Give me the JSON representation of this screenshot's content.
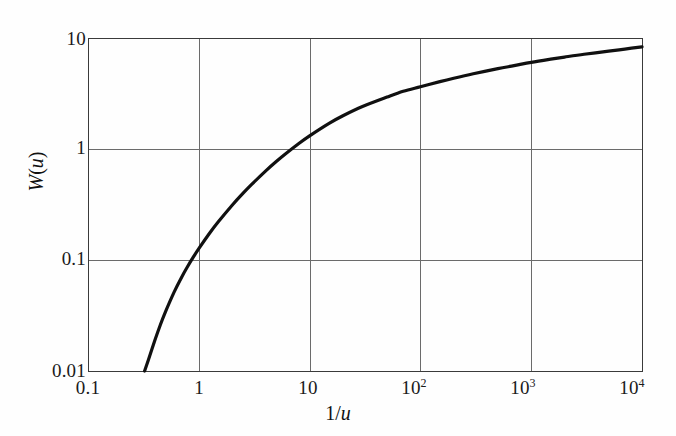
{
  "figure": {
    "background_color": "#fefefe",
    "axis_color": "#3a3a3a",
    "grid_color": "#6b6b6b",
    "curve_color": "#101010"
  },
  "axes": {
    "x_label_plain": "1/",
    "x_label_italic": "u",
    "y_label_plain_w": "W",
    "y_label_open": "(",
    "y_label_italic": "u",
    "y_label_close": ")",
    "x_ticks": [
      {
        "text": "0.1",
        "sup": "",
        "value": 0.1
      },
      {
        "text": "1",
        "sup": "",
        "value": 1
      },
      {
        "text": "10",
        "sup": "",
        "value": 10
      },
      {
        "text": "10",
        "sup": "2",
        "value": 100
      },
      {
        "text": "10",
        "sup": "3",
        "value": 1000
      },
      {
        "text": "10",
        "sup": "4",
        "value": 10000
      }
    ],
    "y_ticks": [
      {
        "text": "10",
        "value": 10
      },
      {
        "text": "1",
        "value": 1
      },
      {
        "text": "0.1",
        "value": 0.1
      },
      {
        "text": "0.01",
        "value": 0.01
      }
    ]
  },
  "chart_data": {
    "type": "line",
    "title": "",
    "xlabel": "1/u",
    "ylabel": "W(u)",
    "xscale": "log",
    "yscale": "log",
    "xlim": [
      0.1,
      10000
    ],
    "ylim": [
      0.01,
      10
    ],
    "grid": true,
    "legend": "none",
    "series": [
      {
        "name": "W(u) Theis well function",
        "x": [
          0.324,
          0.35,
          0.4,
          0.45,
          0.5,
          0.6,
          0.7,
          0.8,
          0.9,
          1.0,
          1.25,
          1.5,
          2.0,
          2.5,
          3.0,
          4.0,
          5.0,
          6.0,
          8.0,
          10.0,
          15.0,
          20.0,
          30.0,
          50.0,
          70.0,
          100.0,
          150.0,
          200.0,
          300.0,
          500.0,
          700.0,
          1000.0,
          1500.0,
          2000.0,
          3000.0,
          5000.0,
          7000.0,
          10000.0
        ],
        "y": [
          0.01,
          0.0125,
          0.0187,
          0.0261,
          0.0341,
          0.0516,
          0.07,
          0.0887,
          0.1076,
          0.1266,
          0.174,
          0.2208,
          0.3115,
          0.3977,
          0.4795,
          0.6328,
          0.7716,
          0.8982,
          1.122,
          1.3145,
          1.7029,
          1.9924,
          2.4118,
          2.9338,
          3.3072,
          3.6374,
          4.0438,
          4.3394,
          4.7618,
          5.2953,
          5.6363,
          6.0332,
          6.4458,
          6.7326,
          7.1383,
          7.6111,
          7.9526,
          8.3315
        ],
        "color": "#101010",
        "width": 3.2
      }
    ]
  }
}
